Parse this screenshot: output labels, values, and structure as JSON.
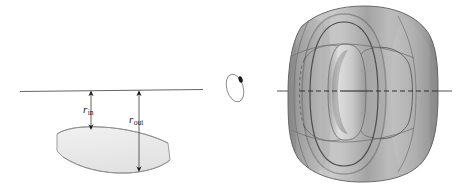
{
  "figure": {
    "background_color": "#ffffff",
    "width": 458,
    "height": 188
  },
  "labels": {
    "r_inner": {
      "symbol": "r",
      "subscript": "in",
      "full": "r_in"
    },
    "r_outer": {
      "symbol": "r",
      "subscript": "out",
      "full": "r_out"
    }
  },
  "left_panel": {
    "name": "cross-section-diagram",
    "axis_line": {
      "name": "axis-of-revolution",
      "x1": 20,
      "y1": 91,
      "x2": 203,
      "y2": 90,
      "color": "#555555",
      "style": "solid"
    },
    "arrows": [
      {
        "name": "r-inner-arrow",
        "label": "r_in",
        "x": 91,
        "y_top": 91,
        "y_bottom": 129,
        "double_headed": true,
        "color": "#1a1a1a"
      },
      {
        "name": "r-outer-arrow",
        "label": "r_out",
        "x": 139,
        "y_top": 91,
        "y_bottom": 172,
        "double_headed": true,
        "color": "#1a1a1a"
      }
    ],
    "lens_shape": {
      "name": "torus-cross-section",
      "fill": "#ebebeb",
      "stroke": "#8a8a8a",
      "description": "tilted lens / leaf shaped region with flattened left and right ends"
    }
  },
  "middle_panel": {
    "name": "small-torus-icon",
    "ellipse": {
      "cx": 235,
      "cy": 88,
      "rx": 8,
      "ry": 14,
      "rotation_deg": -16,
      "stroke": "#777777",
      "fill": "none"
    },
    "marker": {
      "name": "tube-cross-section-dot",
      "cx": 241,
      "cy": 80,
      "rx": 2,
      "ry": 3.2,
      "fill": "#1a1a1a"
    }
  },
  "right_panel": {
    "name": "torus-3d-rendering",
    "bounds": {
      "x": 288,
      "y": 6,
      "width": 150,
      "height": 176
    },
    "axis_line": {
      "name": "axis-of-revolution-3d",
      "x1": 277,
      "y1": 91,
      "x2": 436,
      "y2": 91,
      "color": "#3d3d3d",
      "style": "solid-with-dashed-interior"
    },
    "colors": {
      "highlight": "#d7d7d7",
      "midtone": "#b4b4b4",
      "shadow": "#909090",
      "deep_shadow": "#6f6f6f",
      "outline": "#4a4a4a",
      "inner_hole": "#efefef"
    },
    "description": "Shaded three-dimensional torus viewed nearly edge-on, showing the through hole and latitude/longitude construction curves"
  }
}
